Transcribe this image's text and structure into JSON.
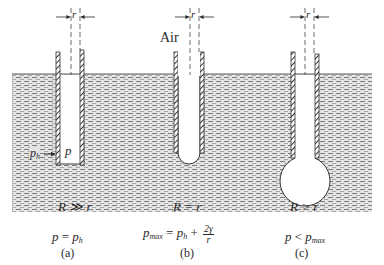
{
  "diagram": {
    "medium_label": "Air",
    "radius_symbol": "r",
    "tubes": [
      {
        "id": "a",
        "caption": "(a)",
        "radius_relation": "R ≫ r",
        "equation": {
          "lhs": "p",
          "op": "=",
          "rhs_base": "p",
          "rhs_sub": "h"
        },
        "inner_label": "p",
        "outer_label_base": "p",
        "outer_label_sub": "h"
      },
      {
        "id": "b",
        "caption": "(b)",
        "radius_relation": "R = r",
        "equation": {
          "lhs_base": "p",
          "lhs_sub": "max",
          "op": "=",
          "rhs_base": "p",
          "rhs_sub": "h",
          "plus": "+",
          "frac_num": "2γ",
          "frac_den": "r"
        }
      },
      {
        "id": "c",
        "caption": "(c)",
        "radius_relation": "R > r",
        "equation": {
          "lhs": "p",
          "op": "<",
          "rhs_base": "p",
          "rhs_sub": "max"
        }
      }
    ],
    "colors": {
      "liquid_fill": "#d9d9d9",
      "liquid_dash": "#8a8a8a",
      "wall": "#3a3a3a",
      "line": "#2a2a2a"
    }
  }
}
